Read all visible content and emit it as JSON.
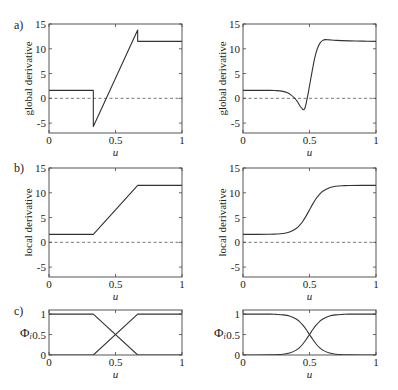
{
  "figure": {
    "panel_labels": [
      "a)",
      "b)",
      "c)"
    ]
  },
  "chart_data": [
    {
      "id": "a-left",
      "type": "line",
      "title": "",
      "panel_label": "a)",
      "xlabel": "u",
      "ylabel": "global derivative",
      "xlim": [
        0,
        1
      ],
      "ylim": [
        -7,
        15
      ],
      "xticks": [
        0,
        0.5,
        1
      ],
      "xtick_labels": [
        "0",
        "0.5",
        "1"
      ],
      "yticks": [
        -5,
        0,
        5,
        10,
        15
      ],
      "ytick_labels": [
        "-5",
        "0",
        "5",
        "10",
        "15"
      ],
      "grid": false,
      "legend": null,
      "reference_lines": [
        {
          "y": 0,
          "style": "dashed"
        }
      ],
      "series": [
        {
          "name": "global derivative (piecewise-linear partition)",
          "interpolation": "linear",
          "x": [
            0,
            0.3333,
            0.3333,
            0.6667,
            0.6667,
            1
          ],
          "y": [
            1.6,
            1.6,
            -5.7,
            13.8,
            11.5,
            11.5
          ]
        }
      ]
    },
    {
      "id": "a-right",
      "type": "line",
      "title": "",
      "panel_label": "",
      "xlabel": "u",
      "ylabel": "global derivative",
      "xlim": [
        0,
        1
      ],
      "ylim": [
        -7,
        15
      ],
      "xticks": [
        0,
        0.5,
        1
      ],
      "xtick_labels": [
        "0",
        "0.5",
        "1"
      ],
      "yticks": [
        -5,
        0,
        5,
        10,
        15
      ],
      "ytick_labels": [
        "-5",
        "0",
        "5",
        "10",
        "15"
      ],
      "grid": false,
      "legend": null,
      "reference_lines": [
        {
          "y": 0,
          "style": "dashed"
        }
      ],
      "series": [
        {
          "name": "global derivative (smooth partition)",
          "interpolation": "smooth",
          "x": [
            0,
            0.2,
            0.25,
            0.3,
            0.33,
            0.36,
            0.39,
            0.41,
            0.43,
            0.445,
            0.455,
            0.465,
            0.475,
            0.49,
            0.5,
            0.52,
            0.54,
            0.56,
            0.58,
            0.6,
            0.62,
            0.65,
            0.7,
            0.8,
            0.9,
            1
          ],
          "y": [
            1.6,
            1.6,
            1.55,
            1.4,
            1.15,
            0.7,
            0.0,
            -0.7,
            -1.6,
            -2.1,
            -2.3,
            -2.0,
            -1.0,
            1.0,
            2.5,
            5.5,
            8.2,
            10.1,
            11.2,
            11.7,
            11.85,
            11.8,
            11.7,
            11.6,
            11.55,
            11.5
          ]
        }
      ]
    },
    {
      "id": "b-left",
      "type": "line",
      "title": "",
      "panel_label": "b)",
      "xlabel": "u",
      "ylabel": "local derivative",
      "xlim": [
        0,
        1
      ],
      "ylim": [
        -7,
        15
      ],
      "xticks": [
        0,
        0.5,
        1
      ],
      "xtick_labels": [
        "0",
        "0.5",
        "1"
      ],
      "yticks": [
        -5,
        0,
        5,
        10,
        15
      ],
      "ytick_labels": [
        "-5",
        "0",
        "5",
        "10",
        "15"
      ],
      "grid": false,
      "legend": null,
      "reference_lines": [
        {
          "y": 0,
          "style": "dashed"
        }
      ],
      "series": [
        {
          "name": "local derivative (piecewise-linear partition)",
          "interpolation": "linear",
          "x": [
            0,
            0.3333,
            0.6667,
            1
          ],
          "y": [
            1.6,
            1.6,
            11.5,
            11.5
          ]
        }
      ]
    },
    {
      "id": "b-right",
      "type": "line",
      "title": "",
      "panel_label": "",
      "xlabel": "u",
      "ylabel": "local derivative",
      "xlim": [
        0,
        1
      ],
      "ylim": [
        -7,
        15
      ],
      "xticks": [
        0,
        0.5,
        1
      ],
      "xtick_labels": [
        "0",
        "0.5",
        "1"
      ],
      "yticks": [
        -5,
        0,
        5,
        10,
        15
      ],
      "ytick_labels": [
        "-5",
        "0",
        "5",
        "10",
        "15"
      ],
      "grid": false,
      "legend": null,
      "reference_lines": [
        {
          "y": 0,
          "style": "dashed"
        }
      ],
      "series": [
        {
          "name": "local derivative (smooth partition)",
          "interpolation": "smooth",
          "x": [
            0,
            0.2,
            0.25,
            0.3,
            0.35,
            0.4,
            0.425,
            0.45,
            0.475,
            0.5,
            0.525,
            0.55,
            0.575,
            0.6,
            0.65,
            0.7,
            0.75,
            0.8,
            1
          ],
          "y": [
            1.6,
            1.62,
            1.67,
            1.78,
            2.07,
            2.78,
            3.4,
            4.26,
            5.34,
            6.55,
            7.76,
            8.84,
            9.7,
            10.32,
            11.03,
            11.32,
            11.43,
            11.48,
            11.5
          ]
        }
      ]
    },
    {
      "id": "c-left",
      "type": "line",
      "title": "",
      "panel_label": "c)",
      "xlabel": "u",
      "ylabel": "Φ_i",
      "ylabel_symbol": "Φ",
      "ylabel_subscript": "i",
      "xlim": [
        0,
        1
      ],
      "ylim": [
        0,
        1.1
      ],
      "xticks": [
        0,
        0.5,
        1
      ],
      "xtick_labels": [
        "0",
        "0.5",
        "1"
      ],
      "yticks": [
        0,
        0.5,
        1
      ],
      "ytick_labels": [
        "0",
        "0.5",
        "1"
      ],
      "grid": false,
      "legend": null,
      "reference_lines": [],
      "series": [
        {
          "name": "Φ1",
          "interpolation": "linear",
          "x": [
            0,
            0.3333,
            0.6667,
            1
          ],
          "y": [
            1,
            1,
            0,
            0
          ]
        },
        {
          "name": "Φ2",
          "interpolation": "linear",
          "x": [
            0,
            0.3333,
            0.6667,
            1
          ],
          "y": [
            0,
            0,
            1,
            1
          ]
        }
      ]
    },
    {
      "id": "c-right",
      "type": "line",
      "title": "",
      "panel_label": "",
      "xlabel": "u",
      "ylabel": "Φ_i",
      "ylabel_symbol": "Φ",
      "ylabel_subscript": "i",
      "xlim": [
        0,
        1
      ],
      "ylim": [
        0,
        1.1
      ],
      "xticks": [
        0,
        0.5,
        1
      ],
      "xtick_labels": [
        "0",
        "0.5",
        "1"
      ],
      "yticks": [
        0,
        0.5,
        1
      ],
      "ytick_labels": [
        "0",
        "0.5",
        "1"
      ],
      "grid": false,
      "legend": null,
      "reference_lines": [],
      "series": [
        {
          "name": "Φ1",
          "interpolation": "smooth",
          "x": [
            0,
            0.2,
            0.25,
            0.3,
            0.35,
            0.4,
            0.425,
            0.45,
            0.475,
            0.5,
            0.525,
            0.55,
            0.575,
            0.6,
            0.65,
            0.7,
            0.75,
            0.8,
            1
          ],
          "y": [
            1.0,
            0.998,
            0.993,
            0.982,
            0.953,
            0.881,
            0.818,
            0.731,
            0.622,
            0.5,
            0.378,
            0.269,
            0.182,
            0.119,
            0.047,
            0.018,
            0.007,
            0.002,
            0.0
          ]
        },
        {
          "name": "Φ2",
          "interpolation": "smooth",
          "x": [
            0,
            0.2,
            0.25,
            0.3,
            0.35,
            0.4,
            0.425,
            0.45,
            0.475,
            0.5,
            0.525,
            0.55,
            0.575,
            0.6,
            0.65,
            0.7,
            0.75,
            0.8,
            1
          ],
          "y": [
            0.0,
            0.002,
            0.007,
            0.018,
            0.047,
            0.119,
            0.182,
            0.269,
            0.378,
            0.5,
            0.622,
            0.731,
            0.818,
            0.881,
            0.953,
            0.982,
            0.993,
            0.998,
            1.0
          ]
        }
      ]
    }
  ]
}
